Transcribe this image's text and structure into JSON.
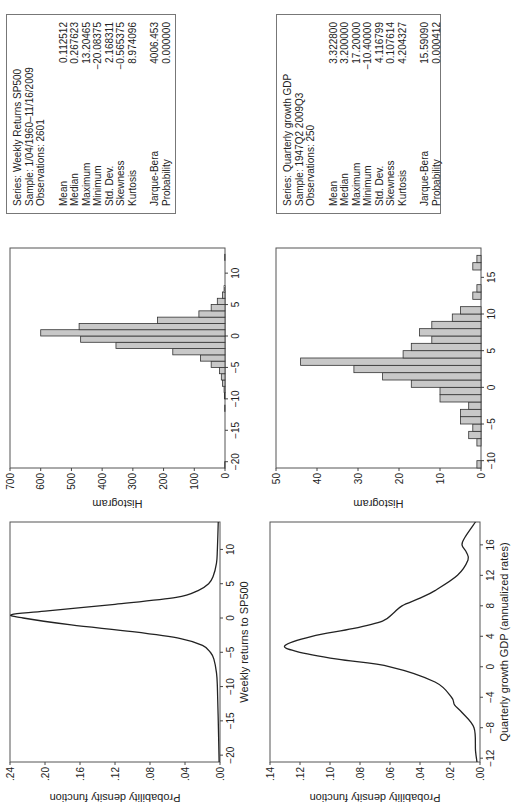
{
  "chart_data": [
    {
      "type": "line",
      "id": "sp500-density",
      "title": "",
      "xlabel": "Weekly returns to SP500",
      "ylabel": "Probability density function",
      "xlim": [
        -21,
        14
      ],
      "ylim": [
        0,
        0.24
      ],
      "xticks": [
        -20,
        -15,
        -10,
        -5,
        0,
        5,
        10
      ],
      "yticks": [
        ".00",
        ".04",
        ".08",
        ".12",
        ".16",
        ".20",
        ".24"
      ],
      "x": [
        -21,
        -15,
        -10,
        -8,
        -6,
        -5,
        -4,
        -3,
        -2,
        -1,
        0,
        0.5,
        1,
        2,
        3,
        4,
        5,
        6,
        8,
        10,
        14
      ],
      "y": [
        0.001,
        0.002,
        0.003,
        0.004,
        0.007,
        0.011,
        0.02,
        0.045,
        0.1,
        0.17,
        0.225,
        0.238,
        0.2,
        0.12,
        0.05,
        0.025,
        0.013,
        0.008,
        0.004,
        0.003,
        0.002
      ]
    },
    {
      "type": "bar",
      "id": "sp500-histogram",
      "ylabel": "Histogram",
      "xlim": [
        -21,
        14
      ],
      "ylim": [
        0,
        700
      ],
      "xticks": [
        -20,
        -15,
        -10,
        -5,
        0,
        5,
        10
      ],
      "yticks": [
        0,
        100,
        200,
        300,
        400,
        500,
        600,
        700
      ],
      "bin_width": 1,
      "categories": [
        -20.5,
        -11.5,
        -9.5,
        -8.5,
        -7.5,
        -6.5,
        -5.5,
        -4.5,
        -3.5,
        -2.5,
        -1.5,
        -0.5,
        0.5,
        1.5,
        2.5,
        3.5,
        4.5,
        5.5,
        6.5,
        7.5,
        12.5
      ],
      "values": [
        1,
        1,
        2,
        3,
        8,
        12,
        18,
        45,
        80,
        170,
        355,
        470,
        600,
        475,
        220,
        85,
        45,
        25,
        8,
        3,
        1
      ]
    },
    {
      "type": "line",
      "id": "gdp-density",
      "xlabel": "Quarterly growth GDP (annualized rates)",
      "ylabel": "Probability density function",
      "xlim": [
        -12.5,
        19
      ],
      "ylim": [
        0,
        0.14
      ],
      "xticks": [
        -12,
        -8,
        -4,
        0,
        4,
        8,
        12,
        16
      ],
      "yticks": [
        ".00",
        ".02",
        ".04",
        ".06",
        ".08",
        ".10",
        ".12",
        ".14"
      ],
      "x": [
        -12.5,
        -11,
        -8,
        -6,
        -5,
        -4,
        -2,
        0,
        1,
        2,
        2.8,
        4,
        5,
        6,
        7,
        8,
        9,
        10,
        12,
        14,
        15,
        16,
        17,
        19
      ],
      "y": [
        0.002,
        0.003,
        0.004,
        0.012,
        0.017,
        0.019,
        0.03,
        0.06,
        0.095,
        0.122,
        0.13,
        0.112,
        0.085,
        0.065,
        0.058,
        0.052,
        0.04,
        0.03,
        0.015,
        0.008,
        0.009,
        0.012,
        0.01,
        0.003
      ]
    },
    {
      "type": "bar",
      "id": "gdp-histogram",
      "ylabel": "Histogram",
      "xlim": [
        -11,
        19
      ],
      "ylim": [
        0,
        50
      ],
      "xticks": [
        -10,
        -5,
        0,
        5,
        10,
        15
      ],
      "yticks": [
        0,
        10,
        20,
        30,
        40,
        50
      ],
      "bin_width": 1,
      "categories": [
        -10.5,
        -7.5,
        -6.5,
        -5.5,
        -4.5,
        -3.5,
        -2.5,
        -1.5,
        -0.5,
        0.5,
        1.5,
        2.5,
        3.5,
        4.5,
        5.5,
        6.5,
        7.5,
        8.5,
        9.5,
        10.5,
        11.5,
        12.5,
        13.5,
        16.5,
        17.5
      ],
      "values": [
        1,
        1,
        3,
        2,
        5,
        5,
        3,
        10,
        10,
        17,
        24,
        31,
        44,
        19,
        17,
        12,
        15,
        12,
        7,
        5,
        0,
        2,
        1,
        2,
        1
      ]
    }
  ],
  "stats": {
    "sp500": {
      "series": "Series: Weekly Returns SP500",
      "sample": "Sample: 1/04/1960–11/16/2009",
      "observations": "Observations: 2601",
      "rows": [
        {
          "label": "Mean",
          "value": "0.112512"
        },
        {
          "label": "Median",
          "value": "0.267623"
        },
        {
          "label": "Maximum",
          "value": "13.20465"
        },
        {
          "label": "Minimum",
          "value": "−20.08375"
        },
        {
          "label": "Std. Dev.",
          "value": "2.168311"
        },
        {
          "label": "Skewness",
          "value": "−0.565375"
        },
        {
          "label": "Kurtosis",
          "value": "8.974096"
        }
      ],
      "jb": {
        "label": "Jarque-Bera",
        "value": "4006.453"
      },
      "prob": {
        "label": "Probability",
        "value": "0.000000"
      }
    },
    "gdp": {
      "series": "Series: Quarterly growth GDP",
      "sample": "Sample: 1947Q2 2009Q3",
      "observations": "Observations: 250",
      "rows": [
        {
          "label": "Mean",
          "value": "3.322800"
        },
        {
          "label": "Median",
          "value": "3.200000"
        },
        {
          "label": "Maximum",
          "value": "17.20000"
        },
        {
          "label": "Minimum",
          "value": "−10.40000"
        },
        {
          "label": "Std. Dev.",
          "value": "4.116799"
        },
        {
          "label": "Skewness",
          "value": "0.107614"
        },
        {
          "label": "Kurtosis",
          "value": "4.204327"
        }
      ],
      "jb": {
        "label": "Jarque-Bera",
        "value": "15.59090"
      },
      "prob": {
        "label": "Probability",
        "value": "0.000412"
      }
    }
  },
  "colors": {
    "bar_fill": "#c8c8c8",
    "bar_stroke": "#333333",
    "line": "#222222",
    "frame": "#555555"
  }
}
